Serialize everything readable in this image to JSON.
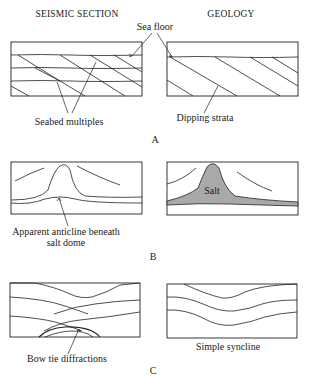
{
  "headers": {
    "left": "SEISMIC SECTION",
    "right": "GEOLOGY"
  },
  "panels": [
    {
      "id": "A",
      "label": "A",
      "left_annotation": "Seabed multiples",
      "right_annotation": "Dipping strata",
      "shared_annotation": "Sea floor"
    },
    {
      "id": "B",
      "label": "B",
      "left_annotation_line1": "Apparent anticline beneath",
      "left_annotation_line2": "salt dome",
      "right_inner_label": "Salt"
    },
    {
      "id": "C",
      "label": "C",
      "left_annotation": "Bow tie diffractions",
      "right_annotation": "Simple syncline"
    }
  ],
  "colors": {
    "line": "#222222",
    "salt_fill": "#a9a9a9",
    "background": "#ffffff"
  }
}
